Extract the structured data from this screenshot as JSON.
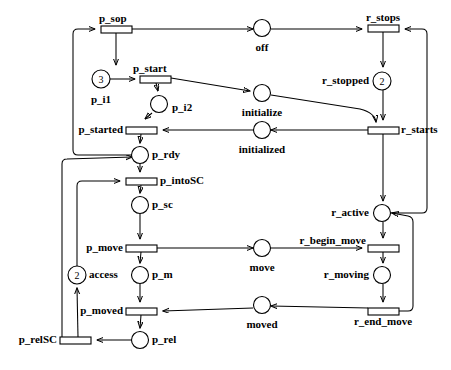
{
  "diagram": {
    "width": 451,
    "height": 370,
    "stroke_color": "#000000",
    "background_color": "#ffffff"
  },
  "places": [
    {
      "id": "p_i1",
      "label": "p_i1",
      "cx": 101,
      "cy": 79,
      "r": 9,
      "tokens": "3",
      "label_x": 101,
      "label_y": 100,
      "align": "mid"
    },
    {
      "id": "p_i2",
      "label": "p_i2",
      "cx": 159,
      "cy": 104,
      "r": 8.5,
      "tokens": "",
      "label_x": 172,
      "label_y": 108,
      "align": "start"
    },
    {
      "id": "off",
      "label": "off",
      "cx": 262,
      "cy": 28,
      "r": 8.5,
      "tokens": "",
      "label_x": 262,
      "label_y": 48,
      "align": "mid"
    },
    {
      "id": "initialize",
      "label": "initialize",
      "cx": 262,
      "cy": 93,
      "r": 8.5,
      "tokens": "",
      "label_x": 262,
      "label_y": 113,
      "align": "mid"
    },
    {
      "id": "initialized",
      "label": "initialized",
      "cx": 262,
      "cy": 130,
      "r": 8.5,
      "tokens": "",
      "label_x": 262,
      "label_y": 150,
      "align": "mid"
    },
    {
      "id": "r_stopped",
      "label": "r_stopped",
      "cx": 382,
      "cy": 81,
      "r": 9,
      "tokens": "2",
      "label_x": 369,
      "label_y": 85,
      "align": "end"
    },
    {
      "id": "p_rdy",
      "label": "p_rdy",
      "cx": 140,
      "cy": 155,
      "r": 8.5,
      "tokens": "",
      "label_x": 153,
      "label_y": 159,
      "align": "start"
    },
    {
      "id": "p_sc",
      "label": "p_sc",
      "cx": 140,
      "cy": 205,
      "r": 8.5,
      "tokens": "",
      "label_x": 153,
      "label_y": 209,
      "align": "start"
    },
    {
      "id": "p_m",
      "label": "p_m",
      "cx": 140,
      "cy": 275,
      "r": 8.5,
      "tokens": "",
      "label_x": 153,
      "label_y": 279,
      "align": "start"
    },
    {
      "id": "p_rel",
      "label": "p_rel",
      "cx": 140,
      "cy": 340,
      "r": 8.5,
      "tokens": "",
      "label_x": 153,
      "label_y": 344,
      "align": "start"
    },
    {
      "id": "access",
      "label": "access",
      "cx": 77,
      "cy": 275,
      "r": 9,
      "tokens": "2",
      "label_x": 90,
      "label_y": 279,
      "align": "start"
    },
    {
      "id": "move",
      "label": "move",
      "cx": 262,
      "cy": 248,
      "r": 8.5,
      "tokens": "",
      "label_x": 262,
      "label_y": 268,
      "align": "mid"
    },
    {
      "id": "moved",
      "label": "moved",
      "cx": 262,
      "cy": 305,
      "r": 8.5,
      "tokens": "",
      "label_x": 262,
      "label_y": 325,
      "align": "mid"
    },
    {
      "id": "r_active",
      "label": "r_active",
      "cx": 382,
      "cy": 213,
      "r": 8.5,
      "tokens": "",
      "label_x": 369,
      "label_y": 217,
      "align": "end"
    },
    {
      "id": "r_moving",
      "label": "r_moving",
      "cx": 382,
      "cy": 275,
      "r": 8.5,
      "tokens": "",
      "label_x": 369,
      "label_y": 279,
      "align": "end"
    }
  ],
  "transitions": [
    {
      "id": "p_sop",
      "label": "p_sop",
      "x": 101,
      "y": 26,
      "w": 31,
      "h": 7,
      "label_x": 101,
      "label_y": 20,
      "align": "start"
    },
    {
      "id": "p_start",
      "label": "p_start",
      "x": 140,
      "y": 76,
      "w": 31,
      "h": 7,
      "label_x": 134,
      "label_y": 70,
      "align": "start"
    },
    {
      "id": "p_started",
      "label": "p_started",
      "x": 126,
      "y": 127,
      "w": 31,
      "h": 7,
      "label_x": 122,
      "label_y": 134,
      "align": "end"
    },
    {
      "id": "p_intoSC",
      "label": "p_intoSC",
      "x": 126,
      "y": 178,
      "w": 31,
      "h": 7,
      "label_x": 161,
      "label_y": 185,
      "align": "start"
    },
    {
      "id": "p_move",
      "label": "p_move",
      "x": 126,
      "y": 245,
      "w": 31,
      "h": 7,
      "label_x": 122,
      "label_y": 252,
      "align": "end"
    },
    {
      "id": "p_moved",
      "label": "p_moved",
      "x": 126,
      "y": 308,
      "w": 31,
      "h": 7,
      "label_x": 122,
      "label_y": 315,
      "align": "end"
    },
    {
      "id": "p_relSC",
      "label": "p_relSC",
      "x": 60,
      "y": 337,
      "w": 31,
      "h": 7,
      "label_x": 56,
      "label_y": 344,
      "align": "end"
    },
    {
      "id": "r_stops",
      "label": "r_stops",
      "x": 368,
      "y": 25,
      "w": 31,
      "h": 7,
      "label_x": 383,
      "label_y": 19,
      "align": "mid"
    },
    {
      "id": "r_starts",
      "label": "r_starts",
      "x": 368,
      "y": 127,
      "w": 31,
      "h": 7,
      "label_x": 402,
      "label_y": 134,
      "align": "start"
    },
    {
      "id": "r_begin_move",
      "label": "r_begin_move",
      "x": 368,
      "y": 245,
      "w": 31,
      "h": 7,
      "label_x": 365,
      "label_y": 241,
      "align": "end"
    },
    {
      "id": "r_end_move",
      "label": "r_end_move",
      "x": 368,
      "y": 308,
      "w": 31,
      "h": 7,
      "label_x": 383,
      "label_y": 322,
      "align": "mid"
    }
  ],
  "arcs": [
    {
      "from": "p_sop",
      "to": "off",
      "kind": "polyline"
    },
    {
      "from": "p_sop",
      "to": "p_i1",
      "kind": "line"
    },
    {
      "from": "p_i1",
      "to": "p_start",
      "kind": "line"
    },
    {
      "from": "p_start",
      "to": "p_i2",
      "kind": "line"
    },
    {
      "from": "p_start",
      "to": "initialize",
      "kind": "line"
    },
    {
      "from": "p_i2",
      "to": "p_started",
      "kind": "line"
    },
    {
      "from": "initialized",
      "to": "p_started",
      "kind": "line"
    },
    {
      "from": "p_started",
      "to": "p_rdy",
      "kind": "line"
    },
    {
      "from": "p_rdy",
      "to": "p_sop",
      "kind": "polyline"
    },
    {
      "from": "p_rdy",
      "to": "p_intoSC",
      "kind": "line"
    },
    {
      "from": "access",
      "to": "p_intoSC",
      "kind": "polyline"
    },
    {
      "from": "p_intoSC",
      "to": "p_sc",
      "kind": "line"
    },
    {
      "from": "p_sc",
      "to": "p_move",
      "kind": "line"
    },
    {
      "from": "p_move",
      "to": "p_m",
      "kind": "line"
    },
    {
      "from": "p_move",
      "to": "move",
      "kind": "line"
    },
    {
      "from": "p_m",
      "to": "p_moved",
      "kind": "line"
    },
    {
      "from": "moved",
      "to": "p_moved",
      "kind": "line"
    },
    {
      "from": "p_moved",
      "to": "p_rel",
      "kind": "line"
    },
    {
      "from": "p_rel",
      "to": "p_relSC",
      "kind": "line"
    },
    {
      "from": "p_relSC",
      "to": "access",
      "kind": "line"
    },
    {
      "from": "p_relSC",
      "to": "p_rdy",
      "kind": "polyline"
    },
    {
      "from": "off",
      "to": "r_stops",
      "kind": "line"
    },
    {
      "from": "r_stops",
      "to": "r_stopped",
      "kind": "line"
    },
    {
      "from": "r_stopped",
      "to": "r_starts",
      "kind": "line"
    },
    {
      "from": "initialize",
      "to": "r_starts",
      "kind": "curve"
    },
    {
      "from": "r_starts",
      "to": "initialized",
      "kind": "line"
    },
    {
      "from": "r_starts",
      "to": "r_active",
      "kind": "line"
    },
    {
      "from": "r_active",
      "to": "r_stops",
      "kind": "polyline"
    },
    {
      "from": "r_active",
      "to": "r_begin_move",
      "kind": "line"
    },
    {
      "from": "move",
      "to": "r_begin_move",
      "kind": "line"
    },
    {
      "from": "r_begin_move",
      "to": "r_moving",
      "kind": "line"
    },
    {
      "from": "r_moving",
      "to": "r_end_move",
      "kind": "line"
    },
    {
      "from": "r_end_move",
      "to": "moved",
      "kind": "line"
    },
    {
      "from": "r_end_move",
      "to": "r_active",
      "kind": "polyline"
    }
  ]
}
